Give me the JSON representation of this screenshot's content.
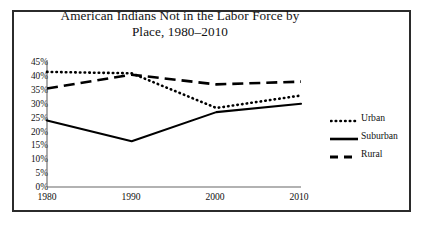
{
  "chart_data": {
    "type": "line",
    "title": "American Indians Not in the Labor Force by Place, 1980–2010",
    "title_line1": "American Indians Not in the Labor Force by",
    "title_line2": "Place, 1980–2010",
    "xlabel": "",
    "ylabel": "",
    "x": [
      1980,
      1990,
      2000,
      2010
    ],
    "categories": [
      "1980",
      "1990",
      "2000",
      "2010"
    ],
    "ylim": [
      0,
      45
    ],
    "ytick_values": [
      45,
      40,
      35,
      30,
      25,
      20,
      15,
      10,
      5,
      0
    ],
    "ytick_labels": [
      "45%",
      "40%",
      "35%",
      "30%",
      "25%",
      "20%",
      "15%",
      "10%",
      "5%",
      "0%"
    ],
    "xtick_labels": [
      "1980",
      "1990",
      "2000",
      "2010"
    ],
    "grid": false,
    "legend_position": "right",
    "series": [
      {
        "name": "Urban",
        "style": "dotted",
        "color": "#000000",
        "values": [
          41.5,
          41.0,
          28.5,
          33.0
        ]
      },
      {
        "name": "Suburban",
        "style": "solid",
        "color": "#000000",
        "values": [
          24.0,
          16.5,
          27.0,
          30.0
        ]
      },
      {
        "name": "Rural",
        "style": "dashed",
        "color": "#000000",
        "values": [
          35.5,
          40.5,
          37.0,
          38.0
        ]
      }
    ]
  },
  "legend": {
    "entries": [
      {
        "label": "Urban",
        "style": "dotted"
      },
      {
        "label": "Suburban",
        "style": "solid"
      },
      {
        "label": "Rural",
        "style": "dashed"
      }
    ]
  },
  "colors": {
    "frame": "#2b2b2b",
    "axis": "#555555",
    "ink": "#000000",
    "background": "#ffffff"
  }
}
